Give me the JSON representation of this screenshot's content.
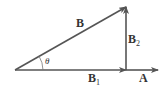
{
  "diagram": {
    "type": "vector-decomposition",
    "colors": {
      "stroke": "#555555",
      "text": "#333333",
      "background": "#ffffff"
    },
    "vectors": {
      "B": {
        "label": "B",
        "from": [
          15,
          70
        ],
        "to": [
          126,
          7
        ]
      },
      "B1": {
        "label": "B",
        "subscript": "1",
        "from": [
          15,
          70
        ],
        "to": [
          126,
          70
        ]
      },
      "B2": {
        "label": "B",
        "subscript": "2",
        "from": [
          126,
          70
        ],
        "to": [
          126,
          7
        ]
      },
      "A": {
        "label": "A",
        "from": [
          126,
          70
        ],
        "to": [
          158,
          70
        ]
      }
    },
    "angle": {
      "label": "θ"
    }
  }
}
